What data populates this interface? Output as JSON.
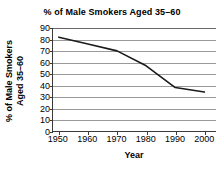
{
  "chart_data": {
    "type": "line",
    "title": "% of Male Smokers Aged 35–60",
    "xlabel": "Year",
    "ylabel_lines": [
      "% of Male Smokers",
      "Aged 35–60"
    ],
    "ylabel": "% of Male Smokers Aged 35–60",
    "x": [
      1950,
      1960,
      1970,
      1980,
      1990,
      2000
    ],
    "xtick_labels": [
      "1950",
      "1960",
      "1970",
      "1980",
      "1990",
      "2000"
    ],
    "values": [
      82,
      76,
      70,
      57,
      38,
      34
    ],
    "yticks": [
      0,
      10,
      20,
      30,
      40,
      50,
      60,
      70,
      80,
      90
    ],
    "ytick_labels": [
      "0",
      "10",
      "20",
      "30",
      "40",
      "50",
      "60",
      "70",
      "80",
      "90"
    ],
    "xlim": [
      1948,
      2004
    ],
    "ylim": [
      0,
      90
    ],
    "grid": "horizontal",
    "legend": "none",
    "line_color": "#1a1a1a",
    "grid_color": "#9a9a9a",
    "axis_color": "#3a3a3a",
    "background_color": "#ffffff"
  }
}
